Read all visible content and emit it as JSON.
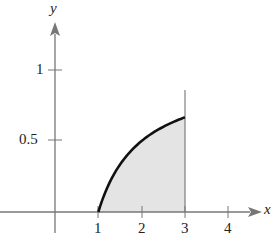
{
  "chart_data": {
    "type": "area",
    "title": "",
    "xlabel": "x",
    "ylabel": "y",
    "function": "y = 1 - 1/x",
    "shaded_region": {
      "x_from": 1,
      "x_to": 3
    },
    "x": [
      1,
      1.25,
      1.5,
      1.75,
      2,
      2.25,
      2.5,
      2.75,
      3
    ],
    "values": [
      0,
      0.2,
      0.333,
      0.429,
      0.5,
      0.556,
      0.6,
      0.636,
      0.667
    ],
    "x_ticks": [
      "1",
      "2",
      "3",
      "4"
    ],
    "y_ticks": [
      "0.5",
      "1"
    ],
    "xlim": [
      -0.9,
      4.9
    ],
    "ylim": [
      0,
      1.2
    ],
    "grid": false,
    "legend": null
  },
  "labels": {
    "x_axis": "x",
    "y_axis": "y",
    "xt1": "1",
    "xt2": "2",
    "xt3": "3",
    "xt4": "4",
    "yt05": "0.5",
    "yt1": "1"
  },
  "colors": {
    "curve": "#111111",
    "fill": "#e4e4e4",
    "axis": "#777777"
  }
}
